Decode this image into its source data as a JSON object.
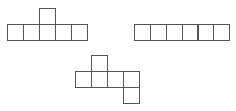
{
  "diagram": {
    "stroke_color": "#555555",
    "background": "#ffffff",
    "square_size": 16,
    "figures": [
      {
        "name": "net-1",
        "layout": "row of 5 with one square above the 3rd",
        "squares": [
          {
            "x": 7,
            "y": 24
          },
          {
            "x": 23,
            "y": 24
          },
          {
            "x": 39,
            "y": 24
          },
          {
            "x": 55,
            "y": 24
          },
          {
            "x": 71,
            "y": 24
          },
          {
            "x": 39,
            "y": 8
          }
        ]
      },
      {
        "name": "net-2",
        "layout": "row of 6",
        "squares": [
          {
            "x": 134,
            "y": 24
          },
          {
            "x": 150,
            "y": 24
          },
          {
            "x": 166,
            "y": 24
          },
          {
            "x": 182,
            "y": 24
          },
          {
            "x": 197,
            "y": 24
          },
          {
            "x": 213,
            "y": 24
          }
        ]
      },
      {
        "name": "net-3",
        "layout": "row of 4, one square above the 2nd, one square below the 4th",
        "squares": [
          {
            "x": 91,
            "y": 55
          },
          {
            "x": 75,
            "y": 71
          },
          {
            "x": 91,
            "y": 71
          },
          {
            "x": 107,
            "y": 71
          },
          {
            "x": 123,
            "y": 71
          },
          {
            "x": 123,
            "y": 87
          }
        ]
      }
    ]
  }
}
